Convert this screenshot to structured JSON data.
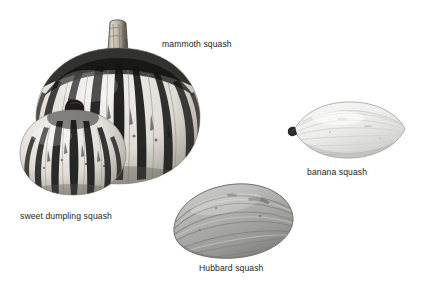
{
  "figure": {
    "kind": "botanical-photo-plate",
    "background_color": "#ffffff",
    "label_color": "#231f20",
    "width": 421,
    "height": 285
  },
  "specimens": [
    {
      "id": "mammoth-squash",
      "label": "mammoth squash",
      "shape": "ribbed round pumpkin with tall ridged stem",
      "pattern": "bold dark vertical stripes on pale ribs",
      "base_color": "#e3e1dc",
      "stripe_color": "#1b1b1b",
      "stem_color": "#b9b4a8",
      "label_x": 162,
      "label_y": 39
    },
    {
      "id": "sweet-dumpling-squash",
      "label": "sweet dumpling squash",
      "shape": "small flattened ribbed pumpkin with short dark stem",
      "pattern": "dark vertical stripes on pale ribs",
      "base_color": "#e6e4df",
      "stripe_color": "#181818",
      "stem_color": "#1d1d1d",
      "label_x": 20,
      "label_y": 211
    },
    {
      "id": "banana-squash",
      "label": "banana squash",
      "shape": "elongated pointed ovoid",
      "pattern": "faint pale lengthwise ribs",
      "base_color": "#ececeb",
      "stripe_color": "#cfcfcd",
      "stem_color": "#2b2b2b",
      "label_x": 307,
      "label_y": 167
    },
    {
      "id": "hubbard-squash",
      "label": "Hubbard squash",
      "shape": "tilted ribbed ovoid",
      "pattern": "grey lengthwise ribs with shading",
      "base_color": "#a9a9a7",
      "stripe_color": "#7d7d7b",
      "stem_color": "#6f6f6d",
      "label_x": 199,
      "label_y": 263
    }
  ]
}
